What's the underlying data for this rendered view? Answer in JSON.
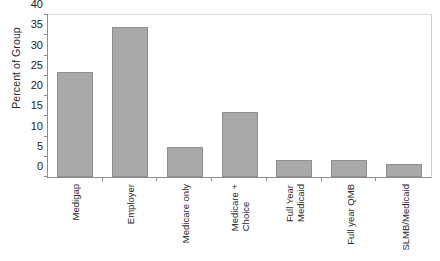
{
  "chart_data": {
    "type": "bar",
    "title": "",
    "xlabel": "",
    "ylabel": "Percent of Group",
    "ylim": [
      0,
      40
    ],
    "yticks": [
      0,
      5,
      10,
      15,
      20,
      25,
      30,
      35,
      40
    ],
    "grid": false,
    "legend": null,
    "bar_color": "#a9a9a9",
    "categories": [
      "Medigap",
      "Employer",
      "Medicare only",
      "Medicare + Choice",
      "Full Year Medicaid",
      "Full year QMB",
      "SLMB/Medicaid"
    ],
    "category_lines": [
      [
        "Medigap"
      ],
      [
        "Employer"
      ],
      [
        "Medicare only"
      ],
      [
        "Medicare +",
        "Choice"
      ],
      [
        "Full Year",
        "Medicaid"
      ],
      [
        "Full year QMB"
      ],
      [
        "SLMB/Medicaid"
      ]
    ],
    "values": [
      26,
      37,
      7.5,
      16,
      4.2,
      4.2,
      3.3
    ]
  }
}
